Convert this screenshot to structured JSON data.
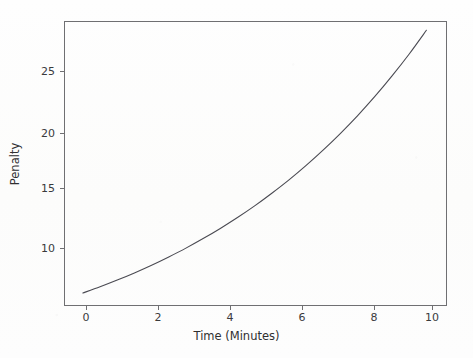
{
  "chart_data": {
    "type": "line",
    "title": "",
    "xlabel": "Time (Minutes)",
    "ylabel": "Penalty",
    "xlim": [
      -0.55,
      10.6
    ],
    "ylim": [
      5.9,
      28.9
    ],
    "xticks": [
      0,
      2,
      4,
      6,
      8,
      10
    ],
    "xticklabels": [
      "0",
      "2",
      "4",
      "6",
      "8",
      "10"
    ],
    "yticks": [
      10,
      15,
      20,
      25
    ],
    "yticklabels": [
      "10",
      "15",
      "20",
      "25"
    ],
    "grid": false,
    "legend": false,
    "line_color": "#4a4a52",
    "line_width": 1.1,
    "series": [
      {
        "name": "Penalty",
        "x": [
          0,
          0.5,
          1,
          1.5,
          2,
          2.5,
          3,
          3.5,
          4,
          4.5,
          5,
          5.5,
          6,
          6.5,
          7,
          7.5,
          8,
          8.5,
          9,
          9.5,
          10
        ],
        "values": [
          6.95,
          7.45,
          7.99,
          8.57,
          9.19,
          9.86,
          10.57,
          11.34,
          12.16,
          13.04,
          13.98,
          15.0,
          16.08,
          17.25,
          18.5,
          19.84,
          21.27,
          22.81,
          24.47,
          26.24,
          28.15
        ]
      }
    ]
  },
  "axes": {
    "frame_color": "#6f6f72",
    "background": "#fdfdfc"
  }
}
